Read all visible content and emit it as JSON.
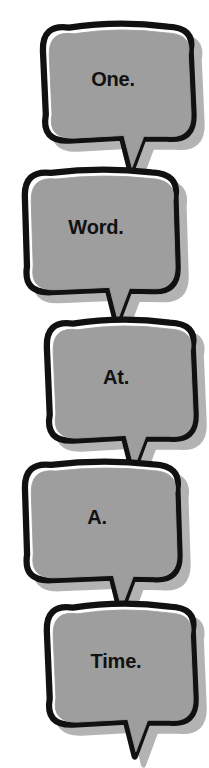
{
  "canvas": {
    "width": 209,
    "height": 768,
    "background": "#ffffff"
  },
  "style": {
    "fill_color": "#9e9e9e",
    "outline_color": "#111111",
    "inner_gap_color": "#ffffff",
    "shadow_color": "#b3b3b3",
    "text_color": "#111111"
  },
  "phrase": "One. Word. At. A. Time.",
  "bubbles": [
    {
      "id": "bubble-1",
      "text": "One.",
      "align": "right",
      "x": 36,
      "y": 18,
      "width": 154,
      "height": 118,
      "font_size": 20,
      "text_y": 50,
      "tail_x": 92
    },
    {
      "id": "bubble-2",
      "text": "Word.",
      "align": "left",
      "x": 18,
      "y": 164,
      "width": 156,
      "height": 124,
      "font_size": 20,
      "text_y": 52,
      "tail_x": 96
    },
    {
      "id": "bubble-3",
      "text": "At.",
      "align": "right",
      "x": 40,
      "y": 314,
      "width": 152,
      "height": 122,
      "font_size": 20,
      "text_y": 52,
      "tail_x": 90
    },
    {
      "id": "bubble-4",
      "text": "A.",
      "align": "left",
      "x": 18,
      "y": 456,
      "width": 158,
      "height": 120,
      "font_size": 20,
      "text_y": 50,
      "tail_x": 100
    },
    {
      "id": "bubble-5",
      "text": "Time.",
      "align": "right",
      "x": 40,
      "y": 598,
      "width": 152,
      "height": 122,
      "font_size": 20,
      "text_y": 52,
      "tail_x": 92
    }
  ]
}
